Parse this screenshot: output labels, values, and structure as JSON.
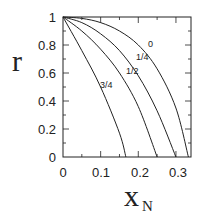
{
  "chart_data": {
    "type": "line",
    "title": "",
    "xlabel": "x",
    "xlabel_subscript": "N",
    "ylabel": "r",
    "xlim": [
      0,
      0.34
    ],
    "ylim": [
      0,
      1
    ],
    "grid": false,
    "x_ticks": [
      "0",
      "0.1",
      "0.2",
      "0.3"
    ],
    "y_ticks": [
      "0",
      "0.2",
      "0.4",
      "0.6",
      "0.8",
      "1"
    ],
    "series": [
      {
        "name": "0",
        "x": [
          0,
          0.05,
          0.1,
          0.15,
          0.2,
          0.25,
          0.3,
          0.333
        ],
        "y": [
          1,
          0.99,
          0.96,
          0.9,
          0.8,
          0.63,
          0.35,
          0
        ]
      },
      {
        "name": "1/4",
        "x": [
          0,
          0.05,
          0.1,
          0.15,
          0.2,
          0.25,
          0.3
        ],
        "y": [
          1,
          0.96,
          0.88,
          0.76,
          0.58,
          0.33,
          0
        ]
      },
      {
        "name": "1/2",
        "x": [
          0,
          0.05,
          0.1,
          0.15,
          0.2,
          0.25
        ],
        "y": [
          1,
          0.9,
          0.77,
          0.6,
          0.36,
          0
        ]
      },
      {
        "name": "3/4",
        "x": [
          0,
          0.05,
          0.1,
          0.15,
          0.167
        ],
        "y": [
          1,
          0.76,
          0.5,
          0.17,
          0
        ]
      }
    ],
    "annotations": [
      {
        "text": "0",
        "x": 0.255,
        "y": 0.82
      },
      {
        "text": "1/4",
        "x": 0.225,
        "y": 0.72
      },
      {
        "text": "1/2",
        "x": 0.2,
        "y": 0.62
      },
      {
        "text": "3/4",
        "x": 0.125,
        "y": 0.5
      }
    ]
  },
  "labels": {
    "y_axis": "r",
    "x_axis_main": "x",
    "x_axis_sub": "N",
    "x_ticks": [
      "0",
      "0.1",
      "0.2",
      "0.3"
    ],
    "y_ticks": [
      "0",
      "0.2",
      "0.4",
      "0.6",
      "0.8",
      "1"
    ],
    "curves": [
      "0",
      "1/4",
      "1/2",
      "3/4"
    ]
  }
}
